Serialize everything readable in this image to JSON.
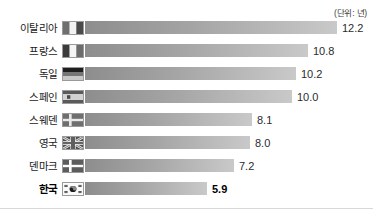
{
  "chart_data": {
    "type": "bar",
    "title": "",
    "subtitle": "",
    "unit_caption": "(단위: 년)",
    "xlabel": "",
    "ylabel": "",
    "orientation": "horizontal",
    "grid": false,
    "legend": "none",
    "xlim": [
      0,
      12.2
    ],
    "categories": [
      "이탈리아",
      "프랑스",
      "독일",
      "스페인",
      "스웨덴",
      "영국",
      "덴마크",
      "한국"
    ],
    "values": [
      12.2,
      10.8,
      10.2,
      10.0,
      8.1,
      8.0,
      7.2,
      5.9
    ],
    "value_labels": [
      "12.2",
      "10.8",
      "10.2",
      "10.0",
      "8.1",
      "8.0",
      "7.2",
      "5.9"
    ],
    "bars": [
      {
        "label": "이탈리아",
        "value": 12.2,
        "value_label": "12.2",
        "flag": "italy-flag-icon",
        "highlight": false
      },
      {
        "label": "프랑스",
        "value": 10.8,
        "value_label": "10.8",
        "flag": "france-flag-icon",
        "highlight": false
      },
      {
        "label": "독일",
        "value": 10.2,
        "value_label": "10.2",
        "flag": "germany-flag-icon",
        "highlight": false
      },
      {
        "label": "스페인",
        "value": 10.0,
        "value_label": "10.0",
        "flag": "spain-flag-icon",
        "highlight": false
      },
      {
        "label": "스웨덴",
        "value": 8.1,
        "value_label": "8.1",
        "flag": "sweden-flag-icon",
        "highlight": false
      },
      {
        "label": "영국",
        "value": 8.0,
        "value_label": "8.0",
        "flag": "uk-flag-icon",
        "highlight": false
      },
      {
        "label": "덴마크",
        "value": 7.2,
        "value_label": "7.2",
        "flag": "denmark-flag-icon",
        "highlight": false
      },
      {
        "label": "한국",
        "value": 5.9,
        "value_label": "5.9",
        "flag": "south-korea-flag-icon",
        "highlight": true
      }
    ],
    "colors": {
      "bar_gradient_start": "#8d8d8d",
      "bar_gradient_end": "#c9c9c9",
      "label_text": "#1a1a1a",
      "value_text": "#2b2b2b",
      "highlight_text": "#000000",
      "baseline": "#d8d8d8",
      "background": "#ffffff"
    }
  }
}
